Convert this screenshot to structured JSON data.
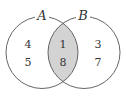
{
  "diagram": {
    "type": "venn",
    "colors": {
      "stroke": "#555555",
      "intersection_fill": "#d3d3d3",
      "background": "#ffffff"
    },
    "sets": [
      {
        "label": "A",
        "only_elements": [
          "4",
          "5"
        ]
      },
      {
        "label": "B",
        "only_elements": [
          "3",
          "7"
        ]
      }
    ],
    "intersection": {
      "label": "A∩B",
      "elements": [
        "1",
        "8"
      ],
      "shaded": true
    }
  }
}
